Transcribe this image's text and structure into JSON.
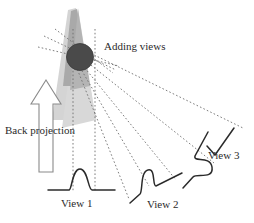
{
  "figure": {
    "type": "diagram",
    "background_color": "#ffffff"
  },
  "labels": {
    "adding_views": "Adding views",
    "back_projection": "Back projection",
    "view_1": "View 1",
    "view_2": "View 2",
    "view_3": "View 3"
  },
  "colors": {
    "stroke": "#2b2b2b",
    "object_fill": "#4a4a4a",
    "wedge_light": "#d0d0d0",
    "wedge_dark": "#a8a8a8",
    "dotted_line": "#6e6e6e",
    "arrow_stroke": "#7a7a7a"
  },
  "elements": {
    "object_circle": {
      "name": "reconstructed-object",
      "cx": 80,
      "cy": 57,
      "r": 13
    },
    "wedge_light": {
      "name": "back-projection-wedge-light",
      "apex_x": 75,
      "apex_y": 8
    },
    "wedge_dark": {
      "name": "back-projection-wedge-overlap"
    },
    "arrow": {
      "name": "back-projection-arrow",
      "direction": "up",
      "x": 33,
      "y_top": 80,
      "y_bottom": 172
    },
    "vertical_dotted_lines": [
      {
        "x": 73,
        "y_top": 30,
        "y_bottom": 190
      },
      {
        "x": 95,
        "y_top": 30,
        "y_bottom": 190
      }
    ],
    "incoming_rays_count": 3,
    "outgoing_rays_count": 5,
    "profiles": [
      {
        "name": "view-1-profile",
        "rotation_deg": 0
      },
      {
        "name": "view-2-profile",
        "rotation_deg": 32
      },
      {
        "name": "view-3-profile",
        "rotation_deg": 88
      }
    ]
  }
}
